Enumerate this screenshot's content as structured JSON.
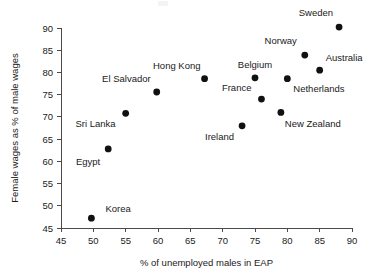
{
  "chart_data": {
    "type": "scatter",
    "title": "",
    "xlabel": "% of unemployed males in EAP",
    "ylabel": "Female wages as % of male wages",
    "xlim": [
      45,
      90
    ],
    "ylim": [
      45,
      90
    ],
    "xticks": [
      45,
      50,
      55,
      60,
      65,
      70,
      75,
      80,
      85,
      90
    ],
    "yticks": [
      45,
      50,
      55,
      60,
      65,
      70,
      75,
      80,
      85,
      90
    ],
    "grid": false,
    "legend": "none",
    "marker_color": "#111111",
    "points": [
      {
        "label": "Korea",
        "x": 49.7,
        "y": 47.2,
        "label_dx": 14,
        "label_dy": -6,
        "anchor": "start"
      },
      {
        "label": "Egypt",
        "x": 52.3,
        "y": 62.8,
        "label_dx": -8,
        "label_dy": 16,
        "anchor": "end"
      },
      {
        "label": "Sri Lanka",
        "x": 55.0,
        "y": 70.8,
        "label_dx": -10,
        "label_dy": 14,
        "anchor": "end"
      },
      {
        "label": "El Salvador",
        "x": 59.8,
        "y": 75.6,
        "label_dx": -6,
        "label_dy": -10,
        "anchor": "end"
      },
      {
        "label": "Hong Kong",
        "x": 67.2,
        "y": 78.6,
        "label_dx": -4,
        "label_dy": -10,
        "anchor": "end"
      },
      {
        "label": "Ireland",
        "x": 73.0,
        "y": 68.0,
        "label_dx": -8,
        "label_dy": 14,
        "anchor": "end"
      },
      {
        "label": "Belgium",
        "x": 75.0,
        "y": 78.8,
        "label_dx": 0,
        "label_dy": -10,
        "anchor": "mid"
      },
      {
        "label": "France",
        "x": 76.0,
        "y": 74.0,
        "label_dx": -10,
        "label_dy": -8,
        "anchor": "end"
      },
      {
        "label": "New Zealand",
        "x": 79.0,
        "y": 71.0,
        "label_dx": 4,
        "label_dy": 15,
        "anchor": "start"
      },
      {
        "label": "Netherlands",
        "x": 80.0,
        "y": 78.6,
        "label_dx": 6,
        "label_dy": 13,
        "anchor": "start"
      },
      {
        "label": "Norway",
        "x": 82.7,
        "y": 83.9,
        "label_dx": -8,
        "label_dy": -11,
        "anchor": "end"
      },
      {
        "label": "Australia",
        "x": 85.0,
        "y": 80.5,
        "label_dx": 6,
        "label_dy": -9,
        "anchor": "start"
      },
      {
        "label": "Sweden",
        "x": 88.0,
        "y": 90.2,
        "label_dx": -6,
        "label_dy": -11,
        "anchor": "end"
      }
    ]
  }
}
